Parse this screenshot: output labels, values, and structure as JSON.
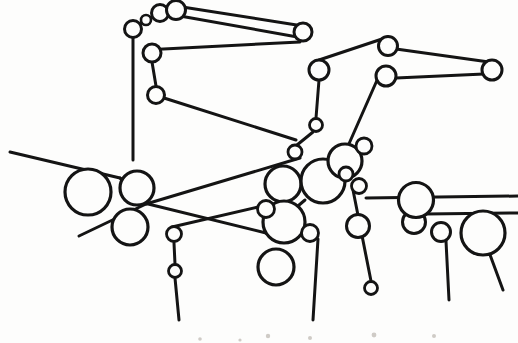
{
  "figure": {
    "width": 518,
    "height": 343,
    "background_color": "#fdfdfc",
    "ink_color": "#141414",
    "node_fill_color": "#fdfdfc",
    "speck_color": "#cfcbc6"
  },
  "chart_data": {
    "type": "scatter",
    "xlabel": "",
    "ylabel": "",
    "xlim": [
      0,
      518
    ],
    "ylim": [
      0,
      343
    ],
    "grid": false,
    "legend": "none",
    "node_count": 34,
    "edge_count": 33,
    "nodes": [
      {
        "id": "n1",
        "label": "",
        "x": 160,
        "y": 13,
        "r": 8.5,
        "stroke": 3.0,
        "size": "small"
      },
      {
        "id": "n2",
        "label": "",
        "x": 176,
        "y": 10,
        "r": 9.5,
        "stroke": 3.0,
        "size": "small"
      },
      {
        "id": "n3",
        "label": "",
        "x": 146,
        "y": 20,
        "r": 5.0,
        "stroke": 2.6,
        "size": "tiny"
      },
      {
        "id": "n4",
        "label": "",
        "x": 133,
        "y": 29,
        "r": 8.5,
        "stroke": 3.0,
        "size": "small"
      },
      {
        "id": "n5",
        "label": "",
        "x": 303,
        "y": 32,
        "r": 9.0,
        "stroke": 3.0,
        "size": "small"
      },
      {
        "id": "n6",
        "label": "",
        "x": 152,
        "y": 53,
        "r": 9.0,
        "stroke": 3.0,
        "size": "small"
      },
      {
        "id": "n7",
        "label": "",
        "x": 156,
        "y": 95,
        "r": 8.5,
        "stroke": 3.0,
        "size": "small"
      },
      {
        "id": "n8",
        "label": "",
        "x": 388,
        "y": 46,
        "r": 9.5,
        "stroke": 3.0,
        "size": "small"
      },
      {
        "id": "n9",
        "label": "",
        "x": 319,
        "y": 70,
        "r": 10.0,
        "stroke": 3.0,
        "size": "small"
      },
      {
        "id": "n10",
        "label": "",
        "x": 492,
        "y": 70,
        "r": 10.0,
        "stroke": 3.0,
        "size": "small"
      },
      {
        "id": "n11",
        "label": "",
        "x": 386,
        "y": 76,
        "r": 10.0,
        "stroke": 3.0,
        "size": "small"
      },
      {
        "id": "n12",
        "label": "",
        "x": 316,
        "y": 125,
        "r": 6.5,
        "stroke": 2.8,
        "size": "tiny"
      },
      {
        "id": "n13",
        "label": "",
        "x": 295,
        "y": 152,
        "r": 7.0,
        "stroke": 2.8,
        "size": "tiny"
      },
      {
        "id": "n14",
        "label": "",
        "x": 88,
        "y": 192,
        "r": 23.0,
        "stroke": 3.2,
        "size": "large"
      },
      {
        "id": "n15",
        "label": "",
        "x": 137,
        "y": 188,
        "r": 17.0,
        "stroke": 3.2,
        "size": "medium"
      },
      {
        "id": "n16",
        "label": "",
        "x": 130,
        "y": 227,
        "r": 18.0,
        "stroke": 3.2,
        "size": "medium"
      },
      {
        "id": "n17",
        "label": "",
        "x": 283,
        "y": 184,
        "r": 18.0,
        "stroke": 3.2,
        "size": "medium"
      },
      {
        "id": "n18",
        "label": "",
        "x": 323,
        "y": 181,
        "r": 22.0,
        "stroke": 3.2,
        "size": "large"
      },
      {
        "id": "n19",
        "label": "",
        "x": 345,
        "y": 161,
        "r": 17.0,
        "stroke": 3.2,
        "size": "medium"
      },
      {
        "id": "n20",
        "label": "",
        "x": 359,
        "y": 186,
        "r": 7.5,
        "stroke": 2.8,
        "size": "tiny"
      },
      {
        "id": "n21",
        "label": "",
        "x": 364,
        "y": 146,
        "r": 8.0,
        "stroke": 2.8,
        "size": "tiny"
      },
      {
        "id": "n22",
        "label": "",
        "x": 284,
        "y": 222,
        "r": 21.0,
        "stroke": 3.2,
        "size": "large"
      },
      {
        "id": "n23",
        "label": "",
        "x": 276,
        "y": 267,
        "r": 18.0,
        "stroke": 3.2,
        "size": "medium"
      },
      {
        "id": "n24",
        "label": "",
        "x": 310,
        "y": 233,
        "r": 8.5,
        "stroke": 2.8,
        "size": "tiny"
      },
      {
        "id": "n25",
        "label": "",
        "x": 358,
        "y": 226,
        "r": 11.5,
        "stroke": 3.0,
        "size": "small"
      },
      {
        "id": "n26",
        "label": "",
        "x": 414,
        "y": 222,
        "r": 11.5,
        "stroke": 3.0,
        "size": "small"
      },
      {
        "id": "n27",
        "label": "",
        "x": 416,
        "y": 200,
        "r": 17.5,
        "stroke": 3.2,
        "size": "medium"
      },
      {
        "id": "n28",
        "label": "",
        "x": 441,
        "y": 232,
        "r": 9.5,
        "stroke": 3.0,
        "size": "small"
      },
      {
        "id": "n29",
        "label": "",
        "x": 483,
        "y": 233,
        "r": 22.0,
        "stroke": 3.2,
        "size": "large"
      },
      {
        "id": "n30",
        "label": "",
        "x": 266,
        "y": 209,
        "r": 8.5,
        "stroke": 2.8,
        "size": "tiny"
      },
      {
        "id": "n31",
        "label": "",
        "x": 175,
        "y": 271,
        "r": 6.5,
        "stroke": 2.8,
        "size": "tiny"
      },
      {
        "id": "n32",
        "label": "",
        "x": 174,
        "y": 234,
        "r": 7.5,
        "stroke": 2.8,
        "size": "tiny"
      },
      {
        "id": "n33",
        "label": "",
        "x": 371,
        "y": 288,
        "r": 6.5,
        "stroke": 2.8,
        "size": "tiny"
      },
      {
        "id": "n34",
        "label": "",
        "x": 346,
        "y": 174,
        "r": 7.0,
        "stroke": 2.8,
        "size": "tiny"
      }
    ],
    "edges": [
      {
        "id": "e1",
        "points": [
          [
            133,
            29
          ],
          [
            146,
            20
          ]
        ],
        "stroke": 2.8
      },
      {
        "id": "e2",
        "points": [
          [
            146,
            20
          ],
          [
            160,
            13
          ]
        ],
        "stroke": 2.8
      },
      {
        "id": "e3",
        "points": [
          [
            160,
            13
          ],
          [
            176,
            10
          ]
        ],
        "stroke": 2.8
      },
      {
        "id": "e4",
        "points": [
          [
            176,
            6
          ],
          [
            303,
            26
          ]
        ],
        "stroke": 3.0
      },
      {
        "id": "e5",
        "points": [
          [
            303,
            38
          ],
          [
            180,
            16
          ]
        ],
        "stroke": 3.0
      },
      {
        "id": "e6",
        "points": [
          [
            133,
            37
          ],
          [
            133,
            160
          ]
        ],
        "stroke": 3.0
      },
      {
        "id": "e7",
        "points": [
          [
            144,
            50
          ],
          [
            300,
            42
          ]
        ],
        "stroke": 3.0
      },
      {
        "id": "e8",
        "points": [
          [
            152,
            62
          ],
          [
            156,
            86
          ]
        ],
        "stroke": 3.0
      },
      {
        "id": "e9",
        "points": [
          [
            164,
            98
          ],
          [
            296,
            140
          ]
        ],
        "stroke": 3.0
      },
      {
        "id": "e10",
        "points": [
          [
            319,
            60
          ],
          [
            388,
            37
          ]
        ],
        "stroke": 3.0
      },
      {
        "id": "e11",
        "points": [
          [
            396,
            49
          ],
          [
            489,
            62
          ]
        ],
        "stroke": 3.0
      },
      {
        "id": "e12",
        "points": [
          [
            484,
            74
          ],
          [
            396,
            78
          ]
        ],
        "stroke": 3.0
      },
      {
        "id": "e13",
        "points": [
          [
            319,
            80
          ],
          [
            316,
            118
          ]
        ],
        "stroke": 3.0
      },
      {
        "id": "e14",
        "points": [
          [
            378,
            78
          ],
          [
            348,
            146
          ]
        ],
        "stroke": 3.0
      },
      {
        "id": "e15",
        "points": [
          [
            313,
            132
          ],
          [
            297,
            145
          ]
        ],
        "stroke": 3.0
      },
      {
        "id": "e16",
        "points": [
          [
            10,
            152
          ],
          [
            120,
            178
          ]
        ],
        "stroke": 3.0
      },
      {
        "id": "e17",
        "points": [
          [
            120,
            178
          ],
          [
            138,
            193
          ]
        ],
        "stroke": 3.0
      },
      {
        "id": "e18",
        "points": [
          [
            300,
            158
          ],
          [
            146,
            204
          ]
        ],
        "stroke": 3.0
      },
      {
        "id": "e19",
        "points": [
          [
            146,
            204
          ],
          [
            79,
            236
          ]
        ],
        "stroke": 3.0
      },
      {
        "id": "e20",
        "points": [
          [
            140,
            202
          ],
          [
            266,
            233
          ]
        ],
        "stroke": 3.0
      },
      {
        "id": "e21",
        "points": [
          [
            266,
            233
          ],
          [
            305,
            200
          ]
        ],
        "stroke": 3.0
      },
      {
        "id": "e22",
        "points": [
          [
            174,
            243
          ],
          [
            175,
            264
          ]
        ],
        "stroke": 3.0
      },
      {
        "id": "e23",
        "points": [
          [
            175,
            278
          ],
          [
            179,
            320
          ]
        ],
        "stroke": 3.0
      },
      {
        "id": "e24",
        "points": [
          [
            172,
            227
          ],
          [
            258,
            207
          ]
        ],
        "stroke": 3.0
      },
      {
        "id": "e25",
        "points": [
          [
            274,
            211
          ],
          [
            283,
            205
          ]
        ],
        "stroke": 3.0
      },
      {
        "id": "e26",
        "points": [
          [
            353,
            190
          ],
          [
            371,
            281
          ]
        ],
        "stroke": 3.0
      },
      {
        "id": "e27",
        "points": [
          [
            366,
            198
          ],
          [
            518,
            196
          ]
        ],
        "stroke": 3.0
      },
      {
        "id": "e28",
        "points": [
          [
            318,
            239
          ],
          [
            313,
            320
          ]
        ],
        "stroke": 3.0
      },
      {
        "id": "e29",
        "points": [
          [
            425,
            214
          ],
          [
            518,
            213
          ]
        ],
        "stroke": 3.0
      },
      {
        "id": "e30",
        "points": [
          [
            446,
            241
          ],
          [
            449,
            300
          ]
        ],
        "stroke": 3.0
      },
      {
        "id": "e31",
        "points": [
          [
            489,
            252
          ],
          [
            503,
            290
          ]
        ],
        "stroke": 3.0
      },
      {
        "id": "e32",
        "points": [
          [
            338,
            168
          ],
          [
            352,
            156
          ]
        ],
        "stroke": 3.0
      },
      {
        "id": "e33",
        "points": [
          [
            356,
            152
          ],
          [
            360,
            150
          ]
        ],
        "stroke": 3.0
      }
    ],
    "specks": [
      {
        "id": "s1",
        "x": 268,
        "y": 336,
        "r": 2.2
      },
      {
        "id": "s2",
        "x": 310,
        "y": 338,
        "r": 2.0
      },
      {
        "id": "s3",
        "x": 374,
        "y": 335,
        "r": 2.4
      },
      {
        "id": "s4",
        "x": 434,
        "y": 336,
        "r": 2.0
      },
      {
        "id": "s5",
        "x": 200,
        "y": 339,
        "r": 1.8
      },
      {
        "id": "s6",
        "x": 240,
        "y": 340,
        "r": 1.6
      }
    ]
  }
}
